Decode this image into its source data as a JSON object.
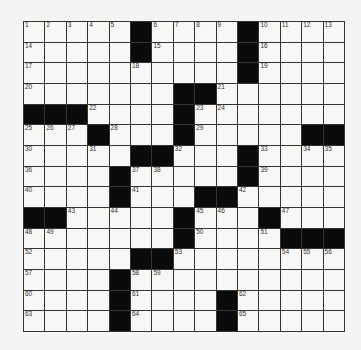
{
  "puzzle": {
    "size": [
      15,
      15
    ],
    "rows": [
      [
        "1",
        "2",
        "3",
        "4",
        "5",
        "#",
        "6",
        "7",
        "8",
        "9",
        "#",
        "10",
        "11",
        "12",
        "13"
      ],
      [
        "14",
        "",
        "",
        "",
        "",
        "#",
        "15",
        "",
        "",
        "",
        "#",
        "16",
        "",
        "",
        ""
      ],
      [
        "17",
        "",
        "",
        "",
        "",
        "18",
        "",
        "",
        "",
        "",
        "#",
        "19",
        "",
        "",
        ""
      ],
      [
        "20",
        "",
        "",
        "",
        "",
        "",
        "",
        "#",
        "#",
        "21",
        "",
        "",
        "",
        "",
        ""
      ],
      [
        "#",
        "#",
        "#",
        "22",
        "",
        "",
        "",
        "#",
        "23",
        "24",
        "",
        "",
        "",
        "",
        ""
      ],
      [
        "25",
        "26",
        "27",
        "#",
        "28",
        "",
        "",
        "#",
        "29",
        "",
        "",
        "",
        "",
        "#",
        "#"
      ],
      [
        "30",
        "",
        "",
        "31",
        "",
        "#",
        "#",
        "32",
        "",
        "",
        "#",
        "33",
        "",
        "34",
        "35"
      ],
      [
        "36",
        "",
        "",
        "",
        "#",
        "37",
        "38",
        "",
        "",
        "",
        "#",
        "39",
        "",
        "",
        ""
      ],
      [
        "40",
        "",
        "",
        "",
        "#",
        "41",
        "",
        "",
        "#",
        "#",
        "42",
        "",
        "",
        "",
        ""
      ],
      [
        "#",
        "#",
        "43",
        "",
        "44",
        "",
        "",
        "#",
        "45",
        "46",
        "",
        "#",
        "47",
        "",
        ""
      ],
      [
        "48",
        "49",
        "",
        "",
        "",
        "",
        "",
        "#",
        "50",
        "",
        "",
        "51",
        "#",
        "#",
        "#"
      ],
      [
        "52",
        "",
        "",
        "",
        "",
        "#",
        "#",
        "53",
        "",
        "",
        "",
        "",
        "54",
        "55",
        "56"
      ],
      [
        "57",
        "",
        "",
        "",
        "#",
        "58",
        "59",
        "",
        "",
        "",
        "",
        "",
        "",
        "",
        ""
      ],
      [
        "60",
        "",
        "",
        "",
        "#",
        "61",
        "",
        "",
        "",
        "#",
        "62",
        "",
        "",
        "",
        ""
      ],
      [
        "63",
        "",
        "",
        "",
        "#",
        "64",
        "",
        "",
        "",
        "#",
        "65",
        "",
        "",
        "",
        ""
      ]
    ]
  },
  "colors": {
    "black_square": "#0a0a0a",
    "white_square": "#f7f7f5",
    "grid_line": "#333333"
  }
}
